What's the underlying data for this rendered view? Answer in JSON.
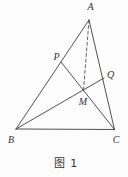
{
  "figure": {
    "caption": "图 1",
    "background": "#fcfcfc",
    "line_color": "#3f3f3f",
    "label_color": "#333333",
    "points": {
      "A": {
        "label": "A",
        "x": 89,
        "y": 20,
        "label_x": 90.5,
        "label_y": 10
      },
      "B": {
        "label": "B",
        "x": 16,
        "y": 129,
        "label_x": 11,
        "label_y": 143
      },
      "C": {
        "label": "C",
        "x": 114.5,
        "y": 129.5,
        "label_x": 116,
        "label_y": 142.5
      },
      "P": {
        "label": "P",
        "x": 61,
        "y": 62,
        "label_x": 56.5,
        "label_y": 59.5
      },
      "Q": {
        "label": "Q",
        "x": 104,
        "y": 78,
        "label_x": 110.5,
        "label_y": 78
      },
      "M": {
        "label": "M",
        "x": 83.5,
        "y": 90.5,
        "label_x": 83,
        "label_y": 104.5
      }
    },
    "segments": [
      {
        "from": "A",
        "to": "B",
        "style": "solid"
      },
      {
        "from": "A",
        "to": "C",
        "style": "solid"
      },
      {
        "from": "B",
        "to": "C",
        "style": "solid"
      },
      {
        "from": "P",
        "to": "C",
        "style": "solid"
      },
      {
        "from": "B",
        "to": "Q",
        "style": "solid"
      },
      {
        "from": "A",
        "to": "M",
        "style": "dashed"
      }
    ]
  }
}
